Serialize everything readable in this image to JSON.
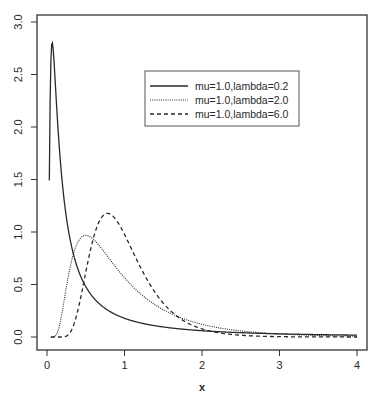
{
  "chart_data": {
    "type": "line",
    "title": "",
    "xlabel": "x",
    "ylabel": "",
    "xlim": [
      0,
      4
    ],
    "ylim": [
      0,
      3
    ],
    "x_ticks": [
      0,
      1,
      2,
      3,
      4
    ],
    "x_tick_labels": [
      "0",
      "1",
      "2",
      "3",
      "4"
    ],
    "y_ticks": [
      0.0,
      0.5,
      1.0,
      1.5,
      2.0,
      2.5,
      3.0
    ],
    "y_tick_labels": [
      "0.0",
      "0.5",
      "1.0",
      "1.5",
      "2.0",
      "2.5",
      "3.0"
    ],
    "grid": false,
    "legend_position": "upper-center",
    "x": [
      0.05,
      0.1,
      0.2,
      0.3,
      0.4,
      0.5,
      0.6,
      0.7,
      0.8,
      0.9,
      1.0,
      1.2,
      1.4,
      1.6,
      1.8,
      2.0,
      2.5,
      3.0,
      3.5,
      4.0
    ],
    "series": [
      {
        "name": "mu=1.0,lambda=0.2",
        "mu": 1.0,
        "lambda": 0.2,
        "line_style": "solid",
        "values": [
          2.62,
          1.6,
          0.83,
          0.55,
          0.4,
          0.31,
          0.25,
          0.2,
          0.17,
          0.15,
          0.13,
          0.1,
          0.08,
          0.066,
          0.056,
          0.048,
          0.035,
          0.026,
          0.021,
          0.017
        ]
      },
      {
        "name": "mu=1.0,lambda=2.0",
        "mu": 1.0,
        "lambda": 2.0,
        "line_style": "dotted",
        "values": [
          0.0,
          0.01,
          0.32,
          0.76,
          0.93,
          0.97,
          0.93,
          0.86,
          0.78,
          0.7,
          0.62,
          0.49,
          0.38,
          0.3,
          0.24,
          0.19,
          0.11,
          0.068,
          0.043,
          0.028
        ]
      },
      {
        "name": "mu=1.0,lambda=6.0",
        "mu": 1.0,
        "lambda": 6.0,
        "line_style": "dashed",
        "values": [
          0.0,
          0.0,
          0.01,
          0.24,
          0.72,
          1.05,
          1.16,
          1.17,
          1.13,
          1.04,
          0.98,
          0.76,
          0.56,
          0.4,
          0.28,
          0.2,
          0.083,
          0.034,
          0.014,
          0.006
        ]
      }
    ]
  },
  "legend": {
    "items": [
      {
        "label": "mu=1.0,lambda=0.2",
        "style": "solid"
      },
      {
        "label": "mu=1.0,lambda=2.0",
        "style": "dotted"
      },
      {
        "label": "mu=1.0,lambda=6.0",
        "style": "dashed"
      }
    ]
  },
  "colors": {
    "ink": "#2a2a2a",
    "frame": "#333333",
    "background": "#ffffff"
  }
}
